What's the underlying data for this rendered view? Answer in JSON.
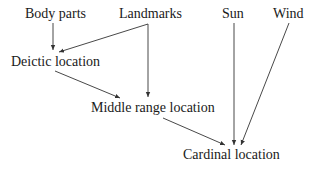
{
  "diagram": {
    "nodes": {
      "body_parts": "Body parts",
      "landmarks": "Landmarks",
      "sun": "Sun",
      "wind": "Wind",
      "deictic": "Deictic location",
      "middle_range": "Middle range location",
      "cardinal": "Cardinal location"
    },
    "edges": [
      {
        "from": "Body parts",
        "to": "Deictic location"
      },
      {
        "from": "Landmarks",
        "to": "Deictic location"
      },
      {
        "from": "Landmarks",
        "to": "Middle range location"
      },
      {
        "from": "Deictic location",
        "to": "Middle range location"
      },
      {
        "from": "Middle range location",
        "to": "Cardinal location"
      },
      {
        "from": "Sun",
        "to": "Cardinal location"
      },
      {
        "from": "Wind",
        "to": "Cardinal location"
      }
    ],
    "colors": {
      "text": "#1a1a1a",
      "line": "#333333",
      "background": "#ffffff"
    }
  }
}
